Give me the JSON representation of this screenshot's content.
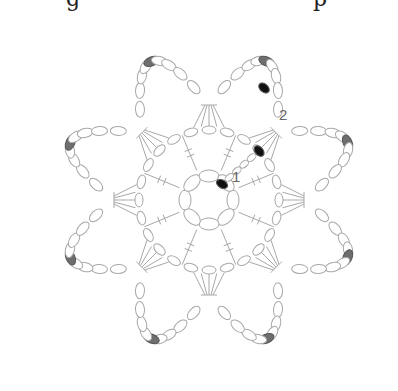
{
  "diagram": {
    "top_text_fragments": [
      {
        "text": "g",
        "x": 66
      },
      {
        "text": "p",
        "x": 313
      }
    ],
    "center": {
      "x": 209,
      "y": 200
    },
    "petals": 8,
    "labels": [
      {
        "text": "1",
        "x": 232,
        "y": 182,
        "name": "round-1-label"
      },
      {
        "text": "2",
        "x": 279,
        "y": 115,
        "name": "round-2-label"
      }
    ],
    "colors": {
      "stroke": "#a8a8a8",
      "slip_stitch_dark": "#111111",
      "join_grey": "#6e6e6e",
      "label": "#666666"
    },
    "legend": {
      "round_1": "1",
      "round_2": "2"
    }
  }
}
